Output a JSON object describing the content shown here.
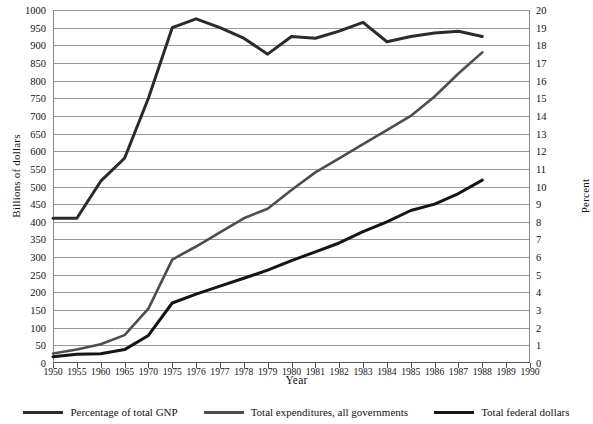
{
  "chart_data": {
    "type": "line",
    "title": "",
    "xlabel": "Year",
    "ylabel": "Billions of dollars",
    "ylabel_right": "Percent",
    "grid": true,
    "legend_position": "bottom",
    "categories": [
      "1950",
      "1955",
      "1960",
      "1965",
      "1970",
      "1975",
      "1976",
      "1977",
      "1978",
      "1979",
      "1980",
      "1981",
      "1982",
      "1983",
      "1984",
      "1985",
      "1986",
      "1987",
      "1988",
      "1989",
      "1990"
    ],
    "ylim": [
      0,
      1000
    ],
    "ylim_right": [
      0,
      20
    ],
    "yticks": [
      0,
      50,
      100,
      150,
      200,
      250,
      300,
      350,
      400,
      450,
      500,
      550,
      600,
      650,
      700,
      750,
      800,
      850,
      900,
      950,
      1000
    ],
    "yticks_right": [
      0,
      1,
      2,
      3,
      4,
      5,
      6,
      7,
      8,
      9,
      10,
      11,
      12,
      13,
      14,
      15,
      16,
      17,
      18,
      19,
      20
    ],
    "series": [
      {
        "name": "Percentage of total GNP",
        "axis": "right",
        "unit": "percent",
        "color": "#2b2b2b",
        "width": 3.0,
        "values": [
          8.2,
          8.2,
          10.3,
          11.6,
          15.0,
          19.0,
          19.5,
          19.0,
          18.4,
          17.5,
          18.5,
          18.4,
          18.8,
          19.3,
          18.2,
          18.5,
          18.7,
          18.8,
          18.5,
          null,
          null
        ]
      },
      {
        "name": "Total expenditures, all governments",
        "axis": "left",
        "unit": "billions_of_dollars",
        "color": "#4d4d4d",
        "width": 2.6,
        "values": [
          27,
          38,
          53,
          79,
          154,
          293,
          330,
          370,
          410,
          437,
          490,
          540,
          580,
          620,
          660,
          700,
          755,
          820,
          880,
          null,
          null
        ]
      },
      {
        "name": "Total federal dollars",
        "axis": "left",
        "unit": "billions_of_dollars",
        "color": "#151515",
        "width": 3.0,
        "values": [
          18,
          25,
          26,
          38,
          78,
          170,
          195,
          218,
          240,
          263,
          290,
          315,
          340,
          372,
          400,
          432,
          450,
          480,
          518,
          null,
          null
        ]
      }
    ]
  },
  "legend": {
    "items": [
      {
        "label": "Percentage of total GNP"
      },
      {
        "label": "Total expenditures, all governments"
      },
      {
        "label": "Total federal dollars"
      }
    ]
  }
}
